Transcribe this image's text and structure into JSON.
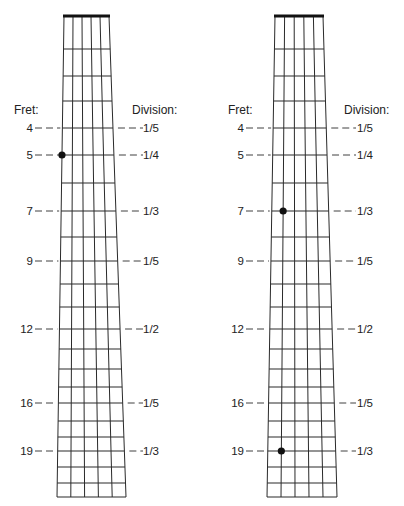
{
  "labels": {
    "fret_header": "Fret:",
    "division_header": "Division:"
  },
  "colors": {
    "line": "#2a2a2a",
    "nut": "#111111",
    "dot": "#111111",
    "text": "#222222",
    "background": "#ffffff"
  },
  "fret_y": [
    16,
    49,
    76,
    101,
    128,
    155,
    183,
    211,
    237,
    261,
    284,
    307,
    329,
    349,
    369,
    387,
    403,
    421,
    437,
    451,
    467,
    483,
    497
  ],
  "strings": 6,
  "marked_frets": [
    {
      "fret": 4,
      "label": "4",
      "division": "1/5"
    },
    {
      "fret": 5,
      "label": "5",
      "division": "1/4"
    },
    {
      "fret": 7,
      "label": "7",
      "division": "1/3"
    },
    {
      "fret": 9,
      "label": "9",
      "division": "1/5"
    },
    {
      "fret": 12,
      "label": "12",
      "division": "1/2"
    },
    {
      "fret": 16,
      "label": "16",
      "division": "1/5"
    },
    {
      "fret": 19,
      "label": "19",
      "division": "1/3"
    }
  ],
  "diagrams": [
    {
      "name": "left-fretboard",
      "top_left_x": 64,
      "top_right_x": 109,
      "bottom_left_x": 57,
      "bottom_right_x": 126,
      "fret_label_right_x": 33,
      "fret_dash_start": 35,
      "division_dash_end": 143,
      "division_text_x": 143,
      "header_fret_x": 14,
      "header_division_x": 132,
      "dots": [
        {
          "fret": 5,
          "string": 1
        }
      ]
    },
    {
      "name": "right-fretboard",
      "top_left_x": 275,
      "top_right_x": 323,
      "bottom_left_x": 267,
      "bottom_right_x": 337,
      "fret_label_right_x": 244,
      "fret_dash_start": 246,
      "division_dash_end": 356,
      "division_text_x": 357,
      "header_fret_x": 228,
      "header_division_x": 344,
      "dots": [
        {
          "fret": 7,
          "string": 2
        },
        {
          "fret": 19,
          "string": 2
        }
      ]
    }
  ]
}
